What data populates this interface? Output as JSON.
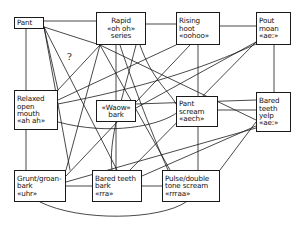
{
  "diagram": {
    "type": "node-link-graph",
    "width": 303,
    "height": 226,
    "background_color": "#ffffff",
    "line_color": "#1a1a1a",
    "text_color": "#111111"
  },
  "nodes": [
    {
      "id": "pant",
      "label": "Pant",
      "lines": [
        "Pant"
      ],
      "x": 14,
      "y": 17,
      "w": 30,
      "h": 12,
      "align": "left"
    },
    {
      "id": "rapid-oh-oh-series",
      "label": "Rapid «oh oh» series",
      "lines": [
        "Rapid",
        "«oh oh»",
        "series"
      ],
      "x": 96,
      "y": 12,
      "w": 50,
      "h": 33,
      "align": "center"
    },
    {
      "id": "rising-hoot",
      "label": "Rising hoot «oohoo»",
      "lines": [
        "Rising",
        "hoot",
        "«oohoo»"
      ],
      "x": 176,
      "y": 12,
      "w": 44,
      "h": 33,
      "align": "left"
    },
    {
      "id": "pout-moan",
      "label": "Pout moan «ae:»",
      "lines": [
        "Pout",
        "moan",
        "«ae:»"
      ],
      "x": 256,
      "y": 12,
      "w": 35,
      "h": 33,
      "align": "left"
    },
    {
      "id": "relaxed-open-mouth",
      "label": "Relaxed open mouth «ah ah»",
      "lines": [
        "Relaxed",
        "open",
        "mouth",
        "«ah ah»"
      ],
      "x": 14,
      "y": 90,
      "w": 44,
      "h": 40,
      "align": "left"
    },
    {
      "id": "waow-bark",
      "label": "«Waow» bark",
      "lines": [
        "«Waow»",
        "bark"
      ],
      "x": 96,
      "y": 100,
      "w": 40,
      "h": 22,
      "align": "center"
    },
    {
      "id": "pant-scream",
      "label": "Pant scream «aech»",
      "lines": [
        "Pant",
        "scream",
        "«aech»"
      ],
      "x": 176,
      "y": 96,
      "w": 42,
      "h": 31,
      "align": "left"
    },
    {
      "id": "bared-teeth-yelp",
      "label": "Bared teeth yelp «ae:»",
      "lines": [
        "Bared",
        "teeth",
        "yelp",
        "«ae:»"
      ],
      "x": 256,
      "y": 92,
      "w": 35,
      "h": 40,
      "align": "left"
    },
    {
      "id": "grunt-groan-bark",
      "label": "Grunt/groan-bark «uhr»",
      "lines": [
        "Grunt/groan-",
        "bark",
        "«uhr»"
      ],
      "x": 14,
      "y": 170,
      "w": 52,
      "h": 32,
      "align": "left"
    },
    {
      "id": "bared-teeth-bark",
      "label": "Bared teeth bark «rra»",
      "lines": [
        "Bared teeth",
        "bark",
        "«rra»"
      ],
      "x": 92,
      "y": 170,
      "w": 50,
      "h": 32,
      "align": "left"
    },
    {
      "id": "pulse-double-tone-scream",
      "label": "Pulse/double tone scream «rrraa»",
      "lines": [
        "Pulse/double",
        "tone scream",
        "«rrraa»"
      ],
      "x": 162,
      "y": 170,
      "w": 58,
      "h": 32,
      "align": "left"
    }
  ],
  "edge_labels": [
    {
      "id": "uncertain-link",
      "text": "?",
      "x": 67,
      "y": 52
    }
  ],
  "edges": [
    {
      "from": "pant",
      "to": "rapid-oh-oh-series",
      "kind": "straight",
      "d": "M 44 21 L 96 21"
    },
    {
      "from": "rapid-oh-oh-series",
      "to": "rising-hoot",
      "kind": "straight",
      "d": "M 146 24 L 176 24"
    },
    {
      "from": "rising-hoot",
      "to": "pout-moan",
      "kind": "straight",
      "d": "M 220 26 L 256 26"
    },
    {
      "from": "pant",
      "to": "relaxed-open-mouth",
      "kind": "straight",
      "d": "M 26 29 L 26 90"
    },
    {
      "from": "rapid-oh-oh-series",
      "to": "waow-bark",
      "kind": "straight",
      "d": "M 116 45 L 116 100"
    },
    {
      "from": "rising-hoot",
      "to": "pant-scream",
      "kind": "straight",
      "d": "M 198 45 L 198 96"
    },
    {
      "from": "pout-moan",
      "to": "bared-teeth-yelp",
      "kind": "straight",
      "d": "M 274 45 L 274 92"
    },
    {
      "from": "relaxed-open-mouth",
      "to": "grunt-groan-bark",
      "kind": "straight",
      "d": "M 26 130 L 26 170"
    },
    {
      "from": "waow-bark",
      "to": "bared-teeth-bark",
      "kind": "straight",
      "d": "M 116 122 L 116 170"
    },
    {
      "from": "pant-scream",
      "to": "pulse-double-tone-scream",
      "kind": "straight",
      "d": "M 198 127 L 198 170"
    },
    {
      "from": "grunt-groan-bark",
      "to": "bared-teeth-bark",
      "kind": "straight",
      "d": "M 66 186 L 92 186"
    },
    {
      "from": "bared-teeth-bark",
      "to": "pulse-double-tone-scream",
      "kind": "straight",
      "d": "M 142 186 L 162 186"
    },
    {
      "from": "pant-scream",
      "to": "bared-teeth-yelp",
      "kind": "straight",
      "d": "M 218 110 L 256 110"
    },
    {
      "from": "pant",
      "to": "relaxed-open-mouth",
      "kind": "straight",
      "d": "M 44 27 L 58 90"
    },
    {
      "from": "pant",
      "to": "bared-teeth-bark",
      "kind": "straight",
      "d": "M 44 27 L 117 170"
    },
    {
      "from": "pant",
      "to": "grunt-groan-bark",
      "kind": "straight",
      "d": "M 44 27 L 70 170"
    },
    {
      "from": "pant",
      "to": "rapid-oh-oh-series",
      "kind": "straight-secondary",
      "d": "M 44 27 L 100 45"
    },
    {
      "from": "relaxed-open-mouth",
      "to": "rapid-oh-oh-series",
      "kind": "question",
      "d": "M 58 90 L 100 45"
    },
    {
      "from": "rapid-oh-oh-series",
      "to": "bared-teeth-yelp",
      "kind": "straight",
      "d": "M 100 45 L 256 120"
    },
    {
      "from": "rapid-oh-oh-series",
      "to": "pulse-double-tone-scream",
      "kind": "straight",
      "d": "M 100 45 L 170 170"
    },
    {
      "from": "rapid-oh-oh-series",
      "to": "grunt-groan-bark",
      "kind": "straight",
      "d": "M 100 45 L 66 170"
    },
    {
      "from": "rapid-oh-oh-series",
      "to": "pant-scream",
      "kind": "curve",
      "d": "M 140 45 C 152 80 170 92 176 104"
    },
    {
      "from": "rapid-oh-oh-series",
      "to": "bared-teeth-bark",
      "kind": "curve",
      "d": "M 136 45 C 122 100 108 140 112 170"
    },
    {
      "from": "rising-hoot",
      "to": "relaxed-open-mouth",
      "kind": "straight",
      "d": "M 176 45 L 58 100"
    },
    {
      "from": "rising-hoot",
      "to": "grunt-groan-bark",
      "kind": "straight",
      "d": "M 190 45 L 66 176"
    },
    {
      "from": "pout-moan",
      "to": "bared-teeth-bark",
      "kind": "straight",
      "d": "M 256 42 L 130 170"
    },
    {
      "from": "pout-moan",
      "to": "waow-bark",
      "kind": "straight",
      "d": "M 256 42 L 136 108"
    },
    {
      "from": "pout-moan",
      "to": "relaxed-open-mouth",
      "kind": "curve",
      "d": "M 256 44 C 200 70 140 88 58 104"
    },
    {
      "from": "bared-teeth-yelp",
      "to": "pulse-double-tone-scream",
      "kind": "straight",
      "d": "M 256 122 L 220 170"
    },
    {
      "from": "bared-teeth-yelp",
      "to": "bared-teeth-bark",
      "kind": "straight",
      "d": "M 256 126 L 142 176"
    },
    {
      "from": "bared-teeth-yelp",
      "to": "grunt-groan-bark",
      "kind": "straight",
      "d": "M 256 128 L 66 182"
    },
    {
      "from": "relaxed-open-mouth",
      "to": "pant-scream",
      "kind": "curve",
      "d": "M 58 122 C 110 136 160 126 178 112"
    },
    {
      "from": "grunt-groan-bark",
      "to": "pulse-double-tone-scream",
      "kind": "curve",
      "d": "M 40 202 C 80 222 160 220 186 202"
    },
    {
      "from": "waow-bark",
      "to": "bared-teeth-yelp",
      "kind": "straight",
      "d": "M 136 104 L 256 100"
    },
    {
      "from": "pulse-double-tone-scream",
      "to": "rapid-oh-oh-series",
      "kind": "curve",
      "d": "M 168 170 C 150 130 128 70 120 45"
    }
  ]
}
